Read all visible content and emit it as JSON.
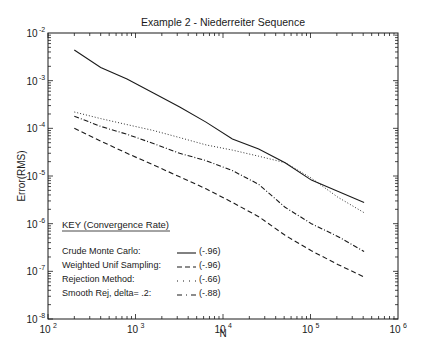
{
  "chart_data": {
    "type": "line",
    "title": "Example 2 - Niederreiter Sequence",
    "xlabel": "N",
    "ylabel": "Error(RMS)",
    "xscale": "log",
    "yscale": "log",
    "xlim": [
      100,
      1000000
    ],
    "ylim": [
      1e-08,
      0.01
    ],
    "grid": false,
    "x_ticks": [
      {
        "base": "10",
        "exp": "2",
        "value": 100
      },
      {
        "base": "10",
        "exp": "3",
        "value": 1000
      },
      {
        "base": "10",
        "exp": "4",
        "value": 10000
      },
      {
        "base": "10",
        "exp": "5",
        "value": 100000
      },
      {
        "base": "10",
        "exp": "6",
        "value": 1000000
      }
    ],
    "y_ticks": [
      {
        "base": "10",
        "exp": "-2",
        "value": 0.01
      },
      {
        "base": "10",
        "exp": "-3",
        "value": 0.001
      },
      {
        "base": "10",
        "exp": "-4",
        "value": 0.0001
      },
      {
        "base": "10",
        "exp": "-5",
        "value": 1e-05
      },
      {
        "base": "10",
        "exp": "-6",
        "value": 1e-06
      },
      {
        "base": "10",
        "exp": "-7",
        "value": 1e-07
      },
      {
        "base": "10",
        "exp": "-8",
        "value": 1e-08
      }
    ],
    "x": [
      200,
      400,
      800,
      1600,
      3200,
      6400,
      12800,
      25600,
      51200,
      102400,
      204800,
      409600
    ],
    "series": [
      {
        "name": "Crude Monte Carlo",
        "rate": "(-.96)",
        "style": "solid",
        "values": [
          0.0044,
          0.0019,
          0.00108,
          0.00055,
          0.00028,
          0.000135,
          6e-05,
          3.7e-05,
          1.9e-05,
          8.2e-06,
          4.8e-06,
          2.8e-06
        ]
      },
      {
        "name": "Weighted Unif Sampling",
        "rate": "(-.96)",
        "style": "dashed",
        "values": [
          0.0001,
          5.4e-05,
          3e-05,
          1.7e-05,
          9.6e-06,
          5.4e-06,
          2.8e-06,
          1.4e-06,
          5.7e-07,
          2.7e-07,
          1.4e-07,
          7.6e-08
        ]
      },
      {
        "name": "Rejection Method",
        "rate": "(-.66)",
        "style": "dotted",
        "values": [
          0.00022,
          0.00016,
          0.00012,
          9e-05,
          6.4e-05,
          4.5e-05,
          3.5e-05,
          2.6e-05,
          1.9e-05,
          9e-06,
          3.6e-06,
          1.7e-06
        ]
      },
      {
        "name": "Smooth Rej, delta= .2",
        "rate": "(-.88)",
        "style": "dashdot",
        "values": [
          0.00018,
          0.00011,
          7.5e-05,
          4.8e-05,
          3e-05,
          2.1e-05,
          1.3e-05,
          6.7e-06,
          2.2e-06,
          1e-06,
          5.4e-07,
          2.6e-07
        ]
      }
    ],
    "legend": {
      "title": "KEY (Convergence Rate)",
      "position": "lower-left inside",
      "entries": [
        {
          "label": "Crude Monte Carlo:",
          "rate": "(-.96)",
          "style": "solid"
        },
        {
          "label": "Weighted Unif Sampling:",
          "rate": "(-.96)",
          "style": "dashed"
        },
        {
          "label": "Rejection Method:",
          "rate": "(-.66)",
          "style": "dotted"
        },
        {
          "label": "Smooth Rej, delta= .2:",
          "rate": "(-.88)",
          "style": "dashdot"
        }
      ]
    }
  },
  "layout": {
    "plot": {
      "left": 48,
      "right": 398,
      "top": 33,
      "bottom": 319
    },
    "line_color": "#1a1a1a"
  }
}
